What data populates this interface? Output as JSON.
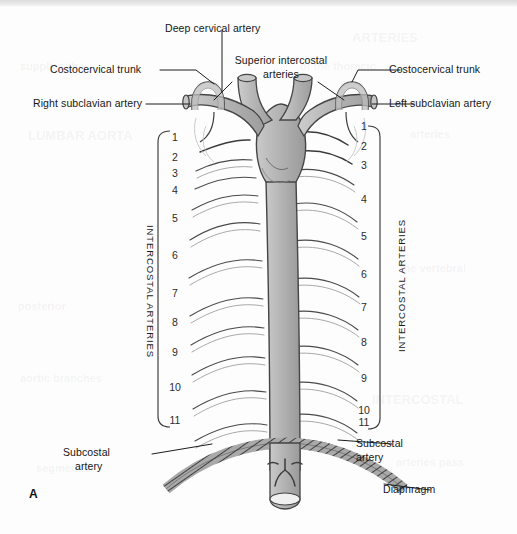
{
  "figure": {
    "panel_letter": "A",
    "background_color": "#fdfdfd",
    "vessel_fill": "#b7b7b7",
    "vessel_stroke": "#4a4a4a",
    "leader_color": "#1c1c1c"
  },
  "labels": {
    "deep_cervical_artery": "Deep cervical artery",
    "superior_intercostal_line1": "Superior intercostal",
    "superior_intercostal_line2": "arteries",
    "costocervical_trunk_left_text": "Costocervical trunk",
    "costocervical_trunk_right_text": "Costocervical trunk",
    "right_subclavian_artery": "Right subclavian artery",
    "left_subclavian_artery": "Left subclavian artery",
    "subcostal_artery_left_line1": "Subcostal",
    "subcostal_artery_left_line2": "artery",
    "subcostal_artery_right_line1": "Subcostal",
    "subcostal_artery_right_line2": "artery",
    "diaphragm": "Diaphragm",
    "intercostal_arteries_left": "INTERCOSTAL ARTERIES",
    "intercostal_arteries_right": "INTERCOSTAL ARTERIES"
  },
  "numbering": {
    "left_numbers": [
      "1",
      "2",
      "3",
      "4",
      "5",
      "6",
      "7",
      "8",
      "9",
      "10",
      "11"
    ],
    "right_numbers": [
      "1",
      "2",
      "3",
      "4",
      "5",
      "6",
      "7",
      "8",
      "9",
      "10",
      "11"
    ],
    "left_y": [
      137,
      157,
      173,
      190,
      218,
      255,
      293,
      322,
      352,
      387,
      420
    ],
    "right_y": [
      126,
      146,
      165,
      199,
      236,
      274,
      307,
      342,
      378,
      410,
      422
    ]
  },
  "bleed_through": [
    {
      "text": "ARTERIES",
      "x": 352,
      "y": 30,
      "size": 13
    },
    {
      "text": "supplies the",
      "x": 20,
      "y": 60,
      "size": 11
    },
    {
      "text": "of the thoracic",
      "x": 300,
      "y": 60,
      "size": 11
    },
    {
      "text": "LUMBAR AORTA",
      "x": 28,
      "y": 128,
      "size": 13
    },
    {
      "text": "arteries",
      "x": 410,
      "y": 128,
      "size": 11
    },
    {
      "text": "posterior",
      "x": 18,
      "y": 300,
      "size": 11
    },
    {
      "text": "the vertebral",
      "x": 400,
      "y": 262,
      "size": 11
    },
    {
      "text": "INTERCOSTAL",
      "x": 372,
      "y": 392,
      "size": 13
    },
    {
      "text": "aortic branches",
      "x": 20,
      "y": 372,
      "size": 11
    },
    {
      "text": "arteries pass",
      "x": 396,
      "y": 456,
      "size": 11
    },
    {
      "text": "segmental",
      "x": 36,
      "y": 462,
      "size": 11
    }
  ]
}
